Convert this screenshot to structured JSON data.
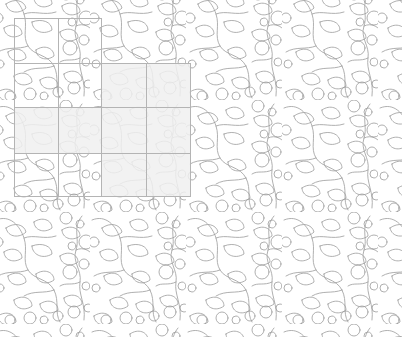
{
  "canvas": {
    "width": 402,
    "height": 337,
    "background_color": "#ffffff",
    "title": "Leaf and Berry Vine Seamless Pattern with Selection Grid"
  },
  "pattern": {
    "name": "leaf-berry-vine-repeat",
    "stroke_color": "#9a9a9a",
    "stroke_width": 0.8,
    "fill": "none",
    "motifs": [
      "leaf",
      "berry-circle",
      "vine-stem"
    ],
    "tile_width": 96,
    "tile_height": 112,
    "description": "Hand drawn outline leaves, round berries and curving vine stems tiled edge to edge"
  },
  "grid": {
    "name": "selection-grid",
    "line_color": "#b4b4b4",
    "line_width": 1,
    "x_lines": [
      14,
      58,
      101,
      146,
      190
    ],
    "y_lines": [
      18,
      63,
      107,
      153,
      196
    ],
    "columns": 4,
    "rows": 4,
    "origin_x": 14,
    "origin_y": 18,
    "width": 176,
    "height": 178
  },
  "selection": {
    "name": "highlighted-cells",
    "fill_color": "#f0f0f0",
    "opacity": 0.85,
    "shape": "L-shaped region",
    "rects": [
      {
        "x": 101,
        "y": 63,
        "width": 89,
        "height": 44
      },
      {
        "x": 14,
        "y": 107,
        "width": 176,
        "height": 46
      },
      {
        "x": 101,
        "y": 153,
        "width": 89,
        "height": 43
      }
    ],
    "cells": [
      {
        "col": 2,
        "row": 1,
        "selected": true
      },
      {
        "col": 3,
        "row": 1,
        "selected": true
      },
      {
        "col": 0,
        "row": 2,
        "selected": true
      },
      {
        "col": 1,
        "row": 2,
        "selected": true
      },
      {
        "col": 2,
        "row": 2,
        "selected": true
      },
      {
        "col": 3,
        "row": 2,
        "selected": true
      },
      {
        "col": 2,
        "row": 3,
        "selected": true
      },
      {
        "col": 3,
        "row": 3,
        "selected": true
      }
    ],
    "selected_count": 8
  },
  "chart_data": {
    "type": "table",
    "title": "Leaf and Berry Vine Seamless Pattern with Selection Grid",
    "categories": [
      "col0",
      "col1",
      "col2",
      "col3"
    ],
    "series": [
      {
        "name": "row0",
        "values": [
          0,
          0,
          0,
          0
        ]
      },
      {
        "name": "row1",
        "values": [
          0,
          0,
          1,
          1
        ]
      },
      {
        "name": "row2",
        "values": [
          1,
          1,
          1,
          1
        ]
      },
      {
        "name": "row3",
        "values": [
          0,
          0,
          1,
          1
        ]
      }
    ],
    "xlabel": "",
    "ylabel": "",
    "legend": [
      "0 = unselected cell",
      "1 = selected cell"
    ]
  }
}
